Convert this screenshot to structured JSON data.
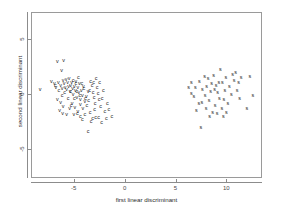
{
  "chart_data": {
    "type": "scatter",
    "title": "",
    "xlabel": "first linear discriminant",
    "ylabel": "second linear discriminant",
    "xlim": [
      -9.2,
      13.5
    ],
    "ylim": [
      -7.6,
      7.4
    ],
    "xticks": [
      -5,
      0,
      5,
      10
    ],
    "xticklabels": [
      "-5",
      "0",
      "5",
      "10"
    ],
    "yticks": [
      5,
      0,
      -5
    ],
    "yticklabels": [
      "5",
      "0",
      "-5"
    ],
    "grid": false,
    "legend": "none",
    "marker_style": "text-glyph",
    "series": [
      {
        "name": "v",
        "label": "v",
        "color": "#1a1a1a",
        "points": [
          [
            -8.3,
            0.35
          ],
          [
            -7.2,
            1.05
          ],
          [
            -6.9,
            0.9
          ],
          [
            -6.75,
            0.55
          ],
          [
            -6.6,
            2.85
          ],
          [
            -6.0,
            3.0
          ],
          [
            -6.2,
            2.1
          ],
          [
            -6.5,
            1.0
          ],
          [
            -6.3,
            0.75
          ],
          [
            -6.15,
            0.45
          ],
          [
            -6.05,
            1.15
          ],
          [
            -5.95,
            0.85
          ],
          [
            -5.85,
            0.55
          ],
          [
            -5.75,
            1.25
          ],
          [
            -5.7,
            0.35
          ],
          [
            -5.6,
            0.95
          ],
          [
            -5.5,
            0.6
          ],
          [
            -5.45,
            1.35
          ],
          [
            -5.35,
            0.2
          ],
          [
            -5.3,
            0.75
          ],
          [
            -5.2,
            1.0
          ],
          [
            -5.1,
            0.45
          ],
          [
            -5.05,
            -0.1
          ],
          [
            -4.95,
            0.65
          ],
          [
            -4.85,
            0.3
          ],
          [
            -4.8,
            1.1
          ],
          [
            -4.7,
            -0.35
          ],
          [
            -4.6,
            0.5
          ],
          [
            -4.5,
            0.05
          ],
          [
            -4.45,
            0.85
          ],
          [
            -4.35,
            -0.55
          ],
          [
            -4.25,
            0.3
          ],
          [
            -4.15,
            -0.2
          ],
          [
            -4.05,
            0.6
          ],
          [
            -6.6,
            -0.55
          ],
          [
            -6.3,
            -0.85
          ],
          [
            -6.05,
            -1.15
          ],
          [
            -6.4,
            -1.55
          ],
          [
            -6.1,
            -1.85
          ],
          [
            -5.7,
            -1.9
          ],
          [
            -5.4,
            -1.35
          ],
          [
            -5.15,
            -0.9
          ],
          [
            -4.9,
            -1.25
          ],
          [
            -4.6,
            -1.6
          ],
          [
            -5.0,
            -1.95
          ],
          [
            -4.35,
            -1.0
          ],
          [
            -4.1,
            -1.4
          ],
          [
            -3.9,
            -0.75
          ],
          [
            -3.75,
            -0.3
          ],
          [
            -3.6,
            0.15
          ]
        ]
      },
      {
        "name": "c",
        "label": "c",
        "color": "#1a1a1a",
        "points": [
          [
            -6.8,
            0.7
          ],
          [
            -6.45,
            0.25
          ],
          [
            -5.55,
            -0.45
          ],
          [
            -5.25,
            -1.1
          ],
          [
            -4.95,
            -0.5
          ],
          [
            -4.7,
            0.2
          ],
          [
            -4.4,
            -0.15
          ],
          [
            -4.2,
            0.85
          ],
          [
            -4.0,
            0.4
          ],
          [
            -3.85,
            -0.45
          ],
          [
            -3.7,
            -1.05
          ],
          [
            -3.55,
            -0.6
          ],
          [
            -3.45,
            0.25
          ],
          [
            -3.35,
            1.1
          ],
          [
            -3.2,
            0.7
          ],
          [
            -3.1,
            0.1
          ],
          [
            -3.0,
            -0.35
          ],
          [
            -2.9,
            -0.9
          ],
          [
            -2.8,
            1.35
          ],
          [
            -2.7,
            0.55
          ],
          [
            -2.6,
            0.0
          ],
          [
            -2.5,
            -0.55
          ],
          [
            -2.95,
            -1.45
          ],
          [
            -3.4,
            -1.75
          ],
          [
            -3.9,
            -1.95
          ],
          [
            -4.35,
            -2.05
          ],
          [
            -2.35,
            -1.15
          ],
          [
            -2.2,
            -0.45
          ],
          [
            -2.1,
            0.3
          ],
          [
            -1.95,
            -1.6
          ],
          [
            -1.7,
            -0.95
          ],
          [
            -1.55,
            -1.45
          ],
          [
            -1.25,
            -2.05
          ],
          [
            -2.55,
            -2.2
          ],
          [
            -3.15,
            -2.3
          ],
          [
            -2.25,
            -2.6
          ],
          [
            -3.6,
            -3.45
          ],
          [
            -4.8,
            0.9
          ],
          [
            -5.05,
            1.2
          ],
          [
            -4.55,
            1.45
          ],
          [
            -3.3,
            -2.5
          ],
          [
            -2.85,
            -2.15
          ],
          [
            -4.15,
            -2.35
          ],
          [
            -4.65,
            -1.85
          ],
          [
            -5.3,
            0.15
          ],
          [
            -5.9,
            0.1
          ],
          [
            -6.15,
            -0.2
          ],
          [
            -3.05,
            0.95
          ],
          [
            -2.45,
            0.95
          ],
          [
            -1.8,
            -2.25
          ]
        ]
      },
      {
        "name": "s",
        "label": "s",
        "color": "#1a1a1a",
        "points": [
          [
            6.3,
            0.55
          ],
          [
            6.55,
            -0.05
          ],
          [
            6.8,
            -0.25
          ],
          [
            6.95,
            0.55
          ],
          [
            7.35,
            1.05
          ],
          [
            7.65,
            0.35
          ],
          [
            7.9,
            -0.15
          ],
          [
            7.6,
            -0.85
          ],
          [
            8.0,
            -1.35
          ],
          [
            8.3,
            -0.6
          ],
          [
            8.45,
            0.15
          ],
          [
            8.55,
            0.9
          ],
          [
            8.2,
            1.35
          ],
          [
            8.75,
            1.6
          ],
          [
            9.0,
            0.75
          ],
          [
            9.15,
            0.1
          ],
          [
            9.3,
            -0.5
          ],
          [
            8.9,
            -1.05
          ],
          [
            9.55,
            -1.4
          ],
          [
            9.75,
            -0.55
          ],
          [
            9.85,
            0.3
          ],
          [
            9.6,
            1.0
          ],
          [
            9.95,
            1.45
          ],
          [
            10.3,
            0.65
          ],
          [
            10.5,
            -0.1
          ],
          [
            10.15,
            -0.95
          ],
          [
            10.75,
            1.15
          ],
          [
            10.9,
            1.85
          ],
          [
            11.05,
            0.3
          ],
          [
            11.3,
            -0.5
          ],
          [
            11.45,
            1.45
          ],
          [
            12.3,
            1.55
          ],
          [
            12.6,
            -0.15
          ],
          [
            12.0,
            -1.35
          ],
          [
            9.4,
            2.2
          ],
          [
            8.65,
            -1.75
          ],
          [
            9.1,
            -1.85
          ],
          [
            7.3,
            -0.95
          ],
          [
            7.05,
            -1.55
          ],
          [
            8.05,
            0.65
          ],
          [
            8.85,
            0.35
          ],
          [
            9.25,
            0.95
          ],
          [
            10.0,
            -1.75
          ],
          [
            7.85,
            1.5
          ],
          [
            6.55,
            1.0
          ],
          [
            7.5,
            -3.05
          ],
          [
            10.6,
            1.75
          ],
          [
            11.2,
            0.95
          ],
          [
            8.35,
            -2.1
          ],
          [
            9.7,
            -2.05
          ]
        ]
      }
    ]
  }
}
